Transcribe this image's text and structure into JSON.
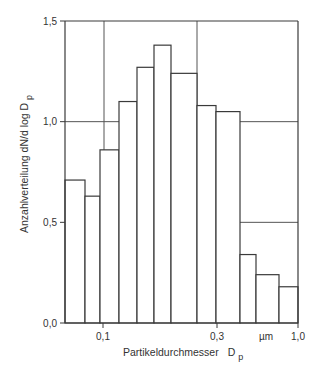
{
  "chart_data": {
    "type": "bar",
    "subtype": "histogram",
    "title": "",
    "xlabel": "Partikeldurchmesser",
    "xlabel_symbol": "D",
    "xlabel_subscript": "p",
    "ylabel": "Anzahlverteilung  dN/d log D",
    "ylabel_subscript": "p",
    "x_scale": "log",
    "x_unit": "µm",
    "xlim": [
      0.063,
      1.0
    ],
    "ylim": [
      0.0,
      1.5
    ],
    "x_ticks": [
      {
        "value": 0.1,
        "label": "0,1"
      },
      {
        "value": 0.3,
        "label": "0,3"
      },
      {
        "value": 1.0,
        "label": "1,0"
      }
    ],
    "y_ticks": [
      {
        "value": 0.0,
        "label": "0,0"
      },
      {
        "value": 0.5,
        "label": "0,5"
      },
      {
        "value": 1.0,
        "label": "1,0"
      },
      {
        "value": 1.5,
        "label": "1,5"
      }
    ],
    "grid": true,
    "legend": null,
    "bins": [
      {
        "x_start": 0.063,
        "x_end": 0.08,
        "value": 0.71
      },
      {
        "x_start": 0.08,
        "x_end": 0.096,
        "value": 0.63
      },
      {
        "x_start": 0.096,
        "x_end": 0.12,
        "value": 0.86
      },
      {
        "x_start": 0.12,
        "x_end": 0.149,
        "value": 1.1
      },
      {
        "x_start": 0.149,
        "x_end": 0.182,
        "value": 1.27
      },
      {
        "x_start": 0.182,
        "x_end": 0.221,
        "value": 1.38
      },
      {
        "x_start": 0.221,
        "x_end": 0.3,
        "value": 1.24
      },
      {
        "x_start": 0.3,
        "x_end": 0.375,
        "value": 1.08
      },
      {
        "x_start": 0.375,
        "x_end": 0.497,
        "value": 1.05
      },
      {
        "x_start": 0.497,
        "x_end": 0.601,
        "value": 0.34
      },
      {
        "x_start": 0.601,
        "x_end": 0.788,
        "value": 0.24
      },
      {
        "x_start": 0.788,
        "x_end": 1.0,
        "value": 0.18
      }
    ],
    "categories": [
      "0.063-0.080",
      "0.080-0.096",
      "0.096-0.120",
      "0.120-0.149",
      "0.149-0.182",
      "0.182-0.221",
      "0.221-0.300",
      "0.300-0.375",
      "0.375-0.497",
      "0.497-0.601",
      "0.601-0.788",
      "0.788-1.000"
    ],
    "values": [
      0.71,
      0.63,
      0.86,
      1.1,
      1.27,
      1.38,
      1.24,
      1.08,
      1.05,
      0.34,
      0.24,
      0.18
    ]
  },
  "layout": {
    "bar_edges_px": [
      65,
      85,
      100,
      119,
      137,
      154,
      171,
      197,
      216,
      240,
      256,
      279,
      298
    ],
    "vgrid_px": [
      104,
      197
    ],
    "xtick_px": [
      103,
      217,
      298
    ],
    "unit_label_px": 266
  }
}
